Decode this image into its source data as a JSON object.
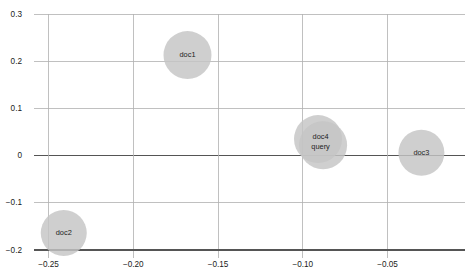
{
  "chart_data": {
    "type": "scatter",
    "title": "",
    "xlabel": "",
    "ylabel": "",
    "xlim": [
      -0.265,
      -0.01
    ],
    "ylim": [
      -0.205,
      0.305
    ],
    "grid": true,
    "legend": null,
    "legend_position": "none",
    "x_ticks": [
      -0.25,
      -0.2,
      -0.15,
      -0.1,
      -0.05
    ],
    "x_tick_labels": [
      "−0.25",
      "−0.20",
      "−0.15",
      "−0.10",
      "−0.05"
    ],
    "y_ticks": [
      0.3,
      0.2,
      0.1,
      0,
      -0.1,
      -0.2
    ],
    "y_tick_labels": [
      "0.3",
      "0.2",
      "0.1",
      "0",
      "−0.1",
      "−0.2"
    ],
    "marker_color": "#c4c4c4",
    "marker_opacity": 0.82,
    "grid_color": "#b0b0b0",
    "axis_color": "#555555",
    "label_color": "#222222",
    "points": [
      {
        "label": "doc1",
        "x": -0.168,
        "y": 0.213,
        "r_px": 24
      },
      {
        "label": "doc2",
        "x": -0.241,
        "y": -0.164,
        "r_px": 23
      },
      {
        "label": "doc3",
        "x": -0.03,
        "y": 0.006,
        "r_px": 23
      },
      {
        "label": "doc4",
        "x": -0.091,
        "y": 0.035,
        "r_px": 24
      },
      {
        "label": "query",
        "x": -0.088,
        "y": 0.022,
        "r_px": 24
      }
    ],
    "label_groups": [
      {
        "labels": [
          "doc1"
        ],
        "x": -0.168,
        "y": 0.213
      },
      {
        "labels": [
          "doc2"
        ],
        "x": -0.241,
        "y": -0.164
      },
      {
        "labels": [
          "doc3"
        ],
        "x": -0.03,
        "y": 0.006
      },
      {
        "labels": [
          "doc4",
          "query"
        ],
        "x": -0.0895,
        "y": 0.029
      }
    ]
  },
  "geometry": {
    "width": 467,
    "height": 275,
    "x_px_at": {
      "-0.25": 48.5,
      "-0.05": 387.5
    },
    "y_px_at": {
      "0.3": 14,
      "-0.2": 250
    }
  }
}
